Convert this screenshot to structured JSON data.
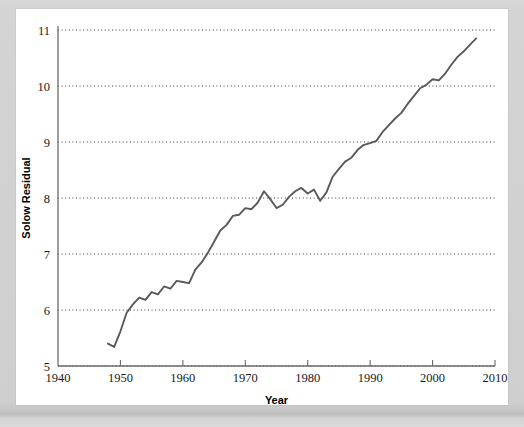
{
  "page": {
    "background_color": "#ffffff",
    "surround_color": "#d6d6d6"
  },
  "chart_data": {
    "type": "line",
    "title": "",
    "subtitle": "",
    "xlabel": "Year",
    "ylabel": "Solow Residual",
    "xlim": [
      1940,
      2010
    ],
    "ylim": [
      5,
      11
    ],
    "xticks": [
      1940,
      1950,
      1960,
      1970,
      1980,
      1990,
      2000,
      2010
    ],
    "xtick_labels": [
      "1940",
      "1950",
      "1960",
      "1970",
      "1980",
      "1990",
      "2000",
      "2010"
    ],
    "yticks": [
      5,
      6,
      7,
      8,
      9,
      10,
      11
    ],
    "ytick_labels": [
      "5",
      "6",
      "7",
      "8",
      "9",
      "10",
      "11"
    ],
    "grid": true,
    "grid_axis": "y",
    "grid_style": "dotted",
    "legend": false,
    "legend_position": "none",
    "line_color": "#595959",
    "axis_color": "#6b6b6b",
    "series": [
      {
        "name": "Solow Residual",
        "x": [
          1948,
          1949,
          1950,
          1951,
          1952,
          1953,
          1954,
          1955,
          1956,
          1957,
          1958,
          1959,
          1960,
          1961,
          1962,
          1963,
          1964,
          1965,
          1966,
          1967,
          1968,
          1969,
          1970,
          1971,
          1972,
          1973,
          1974,
          1975,
          1976,
          1977,
          1978,
          1979,
          1980,
          1981,
          1982,
          1983,
          1984,
          1985,
          1986,
          1987,
          1988,
          1989,
          1990,
          1991,
          1992,
          1993,
          1994,
          1995,
          1996,
          1997,
          1998,
          1999,
          2000,
          2001,
          2002,
          2003,
          2004,
          2005,
          2006,
          2007
        ],
        "values": [
          5.4,
          5.34,
          5.62,
          5.95,
          6.1,
          6.22,
          6.18,
          6.32,
          6.28,
          6.42,
          6.38,
          6.52,
          6.5,
          6.48,
          6.72,
          6.85,
          7.02,
          7.22,
          7.42,
          7.52,
          7.68,
          7.7,
          7.82,
          7.8,
          7.92,
          8.12,
          7.98,
          7.82,
          7.88,
          8.02,
          8.12,
          8.18,
          8.08,
          8.15,
          7.95,
          8.1,
          8.38,
          8.52,
          8.65,
          8.72,
          8.86,
          8.95,
          8.98,
          9.02,
          9.18,
          9.3,
          9.42,
          9.52,
          9.68,
          9.82,
          9.96,
          10.02,
          10.12,
          10.1,
          10.22,
          10.38,
          10.52,
          10.62,
          10.74,
          10.85
        ]
      }
    ]
  }
}
